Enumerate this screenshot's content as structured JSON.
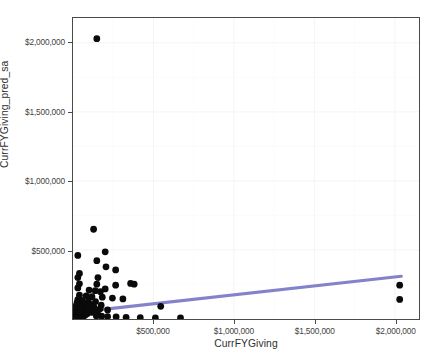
{
  "chart_data": {
    "type": "scatter",
    "title": "",
    "xlabel": "CurrFYGiving",
    "ylabel": "CurrFYGiving_pred_sa",
    "xlim": [
      0,
      2150000
    ],
    "ylim": [
      0,
      2180000
    ],
    "grid": true,
    "legend": null,
    "xticks": [
      500000,
      1000000,
      1500000,
      2000000
    ],
    "yticks": [
      500000,
      1000000,
      1500000,
      2000000
    ],
    "xtick_labels": [
      "$500,000",
      "$1,000,000",
      "$1,500,000",
      "$2,000,000"
    ],
    "ytick_labels": [
      "$500,000",
      "$1,000,000",
      "$1,500,000",
      "$2,000,000"
    ],
    "point_color": "#0a0a0a",
    "point_size": 3.4,
    "trend": {
      "name": "fitted regression line",
      "color": "#7b79c6",
      "x": [
        20000,
        2040000
      ],
      "y": [
        48000,
        310000
      ]
    },
    "series": [
      {
        "name": "CurrFYGiving vs CurrFYGiving_pred_sa",
        "points": [
          [
            148000,
            2030000
          ],
          [
            200000,
            487000
          ],
          [
            128000,
            650000
          ],
          [
            30000,
            460000
          ],
          [
            40000,
            330000
          ],
          [
            148000,
            422000
          ],
          [
            205000,
            378000
          ],
          [
            265000,
            355000
          ],
          [
            30000,
            300000
          ],
          [
            155000,
            300000
          ],
          [
            40000,
            255000
          ],
          [
            148000,
            252000
          ],
          [
            265000,
            245000
          ],
          [
            358000,
            258000
          ],
          [
            380000,
            252000
          ],
          [
            30000,
            225000
          ],
          [
            200000,
            218000
          ],
          [
            100000,
            210000
          ],
          [
            138000,
            205000
          ],
          [
            170000,
            198000
          ],
          [
            40000,
            172000
          ],
          [
            82000,
            168000
          ],
          [
            118000,
            162000
          ],
          [
            182000,
            158000
          ],
          [
            245000,
            152000
          ],
          [
            310000,
            145000
          ],
          [
            30000,
            140000
          ],
          [
            55000,
            135000
          ],
          [
            95000,
            130000
          ],
          [
            140000,
            126000
          ],
          [
            25000,
            118000
          ],
          [
            62000,
            112000
          ],
          [
            108000,
            105000
          ],
          [
            175000,
            100000
          ],
          [
            20000,
            98000
          ],
          [
            48000,
            92000
          ],
          [
            88000,
            88000
          ],
          [
            130000,
            82000
          ],
          [
            22000,
            78000
          ],
          [
            58000,
            72000
          ],
          [
            98000,
            68000
          ],
          [
            18000,
            64000
          ],
          [
            42000,
            60000
          ],
          [
            72000,
            56000
          ],
          [
            112000,
            52000
          ],
          [
            16000,
            50000
          ],
          [
            35000,
            46000
          ],
          [
            60000,
            44000
          ],
          [
            90000,
            40000
          ],
          [
            14000,
            38000
          ],
          [
            30000,
            35000
          ],
          [
            52000,
            32000
          ],
          [
            78000,
            30000
          ],
          [
            12000,
            28000
          ],
          [
            26000,
            26000
          ],
          [
            45000,
            24000
          ],
          [
            68000,
            22000
          ],
          [
            10000,
            20000
          ],
          [
            22000,
            18000
          ],
          [
            38000,
            16000
          ],
          [
            58000,
            15000
          ],
          [
            8000,
            14000
          ],
          [
            18000,
            12000
          ],
          [
            32000,
            11000
          ],
          [
            50000,
            10000
          ],
          [
            7000,
            9000
          ],
          [
            15000,
            8000
          ],
          [
            28000,
            7500
          ],
          [
            44000,
            7000
          ],
          [
            6000,
            6500
          ],
          [
            13000,
            6000
          ],
          [
            24000,
            5500
          ],
          [
            38000,
            5000
          ],
          [
            5000,
            4500
          ],
          [
            11000,
            4000
          ],
          [
            20000,
            3500
          ],
          [
            33000,
            3200
          ],
          [
            4000,
            3000
          ],
          [
            9000,
            2800
          ],
          [
            17000,
            2500
          ],
          [
            29000,
            2200
          ],
          [
            3500,
            2000
          ],
          [
            8000,
            1800
          ],
          [
            15000,
            1600
          ],
          [
            25000,
            1400
          ],
          [
            3000,
            1200
          ],
          [
            7000,
            1000
          ],
          [
            13000,
            900
          ],
          [
            22000,
            800
          ],
          [
            2500,
            700
          ],
          [
            6000,
            600
          ],
          [
            11000,
            500
          ],
          [
            19000,
            450
          ],
          [
            2000,
            400
          ],
          [
            5000,
            350
          ],
          [
            9500,
            300
          ],
          [
            16000,
            250
          ],
          [
            145000,
            22000
          ],
          [
            178000,
            20000
          ],
          [
            215000,
            18000
          ],
          [
            268000,
            16000
          ],
          [
            118000,
            48000
          ],
          [
            152000,
            42000
          ],
          [
            96000,
            62000
          ],
          [
            88000,
            95000
          ],
          [
            128000,
            88000
          ],
          [
            168000,
            74000
          ],
          [
            215000,
            66000
          ],
          [
            330000,
            12000
          ],
          [
            418000,
            10000
          ],
          [
            512000,
            9000
          ],
          [
            668000,
            8000
          ],
          [
            545000,
            92000
          ],
          [
            2030000,
            245000
          ],
          [
            2030000,
            142000
          ]
        ]
      }
    ]
  }
}
